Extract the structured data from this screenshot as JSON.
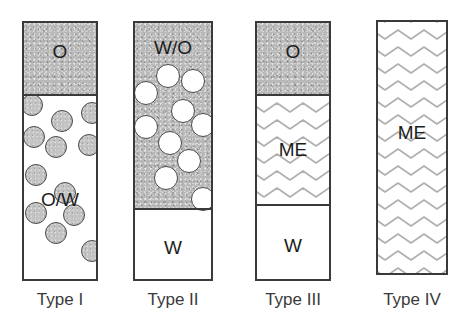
{
  "figure": {
    "background_color": "#ffffff",
    "outline_color": "#3a3a3a",
    "oil_fill_color": "#b9b9b9",
    "water_fill_color": "#ffffff",
    "wave_color": "#b0b0b0"
  },
  "vials": [
    {
      "id": "type-1",
      "caption": "Type I",
      "x": 22,
      "y": 21,
      "w": 76,
      "h": 260,
      "phases": [
        {
          "id": "oil",
          "label": "O",
          "kind": "oil",
          "top": 0,
          "height": 72,
          "label_top": 18
        },
        {
          "id": "oil-in-water",
          "label": "O/W",
          "kind": "water",
          "top": 72,
          "height": 188,
          "label_top": 94
        }
      ],
      "dividers": [
        72
      ],
      "droplets": [
        {
          "kind": "oil",
          "cx": 8,
          "cy": 82,
          "r": 11
        },
        {
          "kind": "oil",
          "cx": 38,
          "cy": 98,
          "r": 11
        },
        {
          "kind": "oil",
          "cx": 68,
          "cy": 90,
          "r": 11
        },
        {
          "kind": "oil",
          "cx": 10,
          "cy": 114,
          "r": 11
        },
        {
          "kind": "oil",
          "cx": 32,
          "cy": 124,
          "r": 11
        },
        {
          "kind": "oil",
          "cx": 65,
          "cy": 122,
          "r": 11
        },
        {
          "kind": "oil",
          "cx": 12,
          "cy": 152,
          "r": 11
        },
        {
          "kind": "oil",
          "cx": 41,
          "cy": 170,
          "r": 11
        },
        {
          "kind": "oil",
          "cx": 50,
          "cy": 192,
          "r": 11
        },
        {
          "kind": "oil",
          "cx": 12,
          "cy": 190,
          "r": 11
        },
        {
          "kind": "oil",
          "cx": 32,
          "cy": 210,
          "r": 11
        },
        {
          "kind": "oil",
          "cx": 68,
          "cy": 228,
          "r": 11
        }
      ]
    },
    {
      "id": "type-2",
      "caption": "Type II",
      "x": 133,
      "y": 21,
      "w": 80,
      "h": 260,
      "phases": [
        {
          "id": "water-in-oil",
          "label": "W/O",
          "kind": "oil",
          "top": 0,
          "height": 186,
          "label_top": 14
        },
        {
          "id": "water",
          "label": "W",
          "kind": "water",
          "top": 186,
          "height": 74,
          "label_top": 28
        }
      ],
      "dividers": [
        186
      ],
      "droplets": [
        {
          "kind": "water",
          "cx": 33,
          "cy": 53,
          "r": 12
        },
        {
          "kind": "water",
          "cx": 58,
          "cy": 58,
          "r": 12
        },
        {
          "kind": "water",
          "cx": 11,
          "cy": 70,
          "r": 12
        },
        {
          "kind": "water",
          "cx": 48,
          "cy": 88,
          "r": 12
        },
        {
          "kind": "water",
          "cx": 11,
          "cy": 104,
          "r": 12
        },
        {
          "kind": "water",
          "cx": 68,
          "cy": 102,
          "r": 12
        },
        {
          "kind": "water",
          "cx": 35,
          "cy": 120,
          "r": 12
        },
        {
          "kind": "water",
          "cx": 54,
          "cy": 138,
          "r": 12
        },
        {
          "kind": "water",
          "cx": 31,
          "cy": 155,
          "r": 12
        },
        {
          "kind": "water",
          "cx": 68,
          "cy": 176,
          "r": 12
        }
      ]
    },
    {
      "id": "type-3",
      "caption": "Type III",
      "x": 255,
      "y": 21,
      "w": 76,
      "h": 260,
      "phases": [
        {
          "id": "oil",
          "label": "O",
          "kind": "oil",
          "top": 0,
          "height": 72,
          "label_top": 18
        },
        {
          "id": "microemulsion",
          "label": "ME",
          "kind": "me",
          "top": 72,
          "height": 110,
          "label_top": 44
        },
        {
          "id": "water",
          "label": "W",
          "kind": "water",
          "top": 182,
          "height": 78,
          "label_top": 30
        }
      ],
      "dividers": [
        72,
        182
      ],
      "droplets": []
    },
    {
      "id": "type-4",
      "caption": "Type IV",
      "x": 376,
      "y": 20,
      "w": 72,
      "h": 255,
      "phases": [
        {
          "id": "microemulsion",
          "label": "ME",
          "kind": "me",
          "top": 0,
          "height": 255,
          "label_top": 100
        }
      ],
      "dividers": [],
      "droplets": []
    }
  ],
  "captions": [
    {
      "text": "Type I",
      "x": 22,
      "w": 76,
      "y": 290
    },
    {
      "text": "Type II",
      "x": 130,
      "w": 86,
      "y": 290
    },
    {
      "text": "Type III",
      "x": 250,
      "w": 86,
      "y": 290
    },
    {
      "text": "Type IV",
      "x": 372,
      "w": 80,
      "y": 290
    }
  ]
}
